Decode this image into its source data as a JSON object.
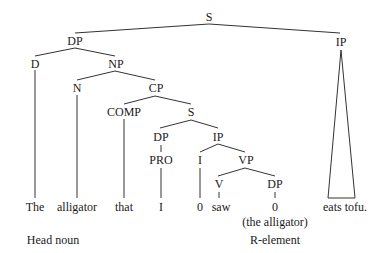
{
  "tree": {
    "root": "S",
    "nodes": {
      "s_root": "S",
      "dp_top": "DP",
      "ip_top": "IP",
      "d": "D",
      "np": "NP",
      "n": "N",
      "cp": "CP",
      "comp": "COMP",
      "s_inner": "S",
      "dp_inner": "DP",
      "ip_inner": "IP",
      "pro": "PRO",
      "i": "I",
      "vp": "VP",
      "v": "V",
      "dp_obj": "DP"
    },
    "leaves": {
      "the": "The",
      "alligator": "alligator",
      "that": "that",
      "i_word": "I",
      "zero_infl": "0",
      "saw": "saw",
      "zero_obj": "0",
      "eats_tofu": "eats tofu."
    },
    "annotations": {
      "the_alligator": "(the alligator)",
      "head_noun": "Head noun",
      "r_element": "R-element"
    }
  },
  "colors": {
    "line": "#333333",
    "text": "#1a1a1a",
    "background": "#ffffff"
  }
}
